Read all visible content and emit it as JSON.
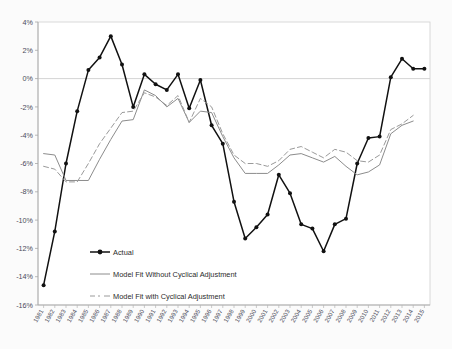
{
  "chart_data": {
    "type": "line",
    "title": "",
    "subtitle": "",
    "xlabel": "",
    "ylabel": "",
    "grid": "horizontal-zero-only",
    "legend_position": "inside-lower-left",
    "ylim": [
      -16,
      4
    ],
    "ytick_labels": [
      "4%",
      "2%",
      "0%",
      "-2%",
      "-4%",
      "-6%",
      "-8%",
      "-10%",
      "-12%",
      "-14%",
      "-16%"
    ],
    "ytick_values": [
      4,
      2,
      0,
      -2,
      -4,
      -6,
      -8,
      -10,
      -12,
      -14,
      -16
    ],
    "categories": [
      "1981",
      "1982",
      "1983",
      "1984",
      "1985",
      "1986",
      "1987",
      "1988",
      "1989",
      "1990",
      "1991",
      "1992",
      "1993",
      "1994",
      "1995",
      "1996",
      "1997",
      "1998",
      "1999",
      "2000",
      "2001",
      "2002",
      "2003",
      "2004",
      "2005",
      "2006",
      "2007",
      "2008",
      "2009",
      "2010",
      "2011",
      "2012",
      "2013",
      "2014",
      "2015"
    ],
    "series": [
      {
        "name": "Actual",
        "style": "solid-with-markers",
        "color": "#111111",
        "values": [
          -14.6,
          -10.8,
          -6.0,
          -2.3,
          0.6,
          1.5,
          3.0,
          1.0,
          -2.0,
          0.3,
          -0.4,
          -0.8,
          0.3,
          -2.1,
          -0.1,
          -3.3,
          -4.6,
          -8.7,
          -11.3,
          -10.5,
          -9.6,
          -6.8,
          -8.1,
          -10.3,
          -10.6,
          -12.2,
          -10.3,
          -9.9,
          -6.0,
          -4.2,
          -4.1,
          0.1,
          1.4,
          0.7,
          0.7
        ]
      },
      {
        "name": "Model Fit Without Cyclical Adjustment",
        "style": "solid",
        "color": "#8c8c8c",
        "values": [
          -5.3,
          -5.4,
          -7.2,
          -7.2,
          -7.2,
          -5.7,
          -4.3,
          -3.0,
          -2.9,
          -0.8,
          -1.2,
          -2.0,
          -1.4,
          -3.1,
          -2.3,
          -2.4,
          -4.1,
          -5.6,
          -6.7,
          -6.7,
          -6.7,
          -6.1,
          -5.4,
          -5.3,
          -5.6,
          -5.9,
          -5.5,
          -6.2,
          -6.8,
          -6.6,
          -6.1,
          -3.9,
          -3.3,
          -3.0,
          null
        ]
      },
      {
        "name": "Model Fit with Cyclical Adjustment",
        "style": "dashed",
        "color": "#9a9a9a",
        "values": [
          -6.2,
          -6.4,
          -7.3,
          -7.3,
          -6.0,
          -4.6,
          -3.5,
          -2.4,
          -2.3,
          -1.0,
          -1.3,
          -1.9,
          -1.2,
          -3.1,
          -1.4,
          -2.0,
          -3.9,
          -5.4,
          -6.0,
          -6.0,
          -6.2,
          -5.8,
          -5.0,
          -4.8,
          -5.2,
          -5.6,
          -5.0,
          -5.2,
          -5.8,
          -5.9,
          -5.4,
          -3.6,
          -3.2,
          -2.6,
          null
        ]
      }
    ]
  },
  "legend": {
    "items": [
      {
        "label": "Actual",
        "marker": "line-with-diamond-marker",
        "color": "#111111"
      },
      {
        "label": "Model Fit Without Cyclical Adjustment",
        "marker": "solid-line",
        "color": "#8c8c8c"
      },
      {
        "label": "Model Fit with Cyclical Adjustment",
        "marker": "dashed-line",
        "color": "#9a9a9a"
      }
    ]
  }
}
